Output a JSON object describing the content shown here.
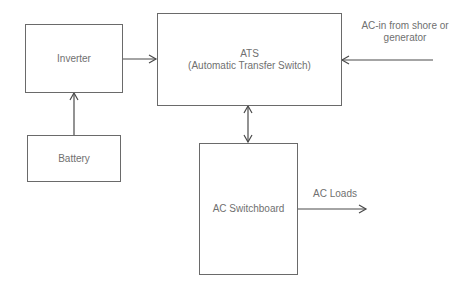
{
  "diagram": {
    "nodes": [
      {
        "id": "inverter",
        "label": "Inverter"
      },
      {
        "id": "ats",
        "label_line1": "ATS",
        "label_line2": "(Automatic Transfer Switch)"
      },
      {
        "id": "battery",
        "label": "Battery"
      },
      {
        "id": "ac_switchboard",
        "label": "AC Switchboard"
      }
    ],
    "edge_labels": {
      "ac_in": "AC-in from shore or generator",
      "ac_in_line1": "AC-in from shore or",
      "ac_in_line2": "generator",
      "ac_loads": "AC Loads"
    },
    "edges": [
      {
        "from": "battery",
        "to": "inverter",
        "type": "arrow"
      },
      {
        "from": "inverter",
        "to": "ats",
        "type": "arrow"
      },
      {
        "from": "ac_in",
        "to": "ats",
        "type": "arrow"
      },
      {
        "from": "ats",
        "to": "ac_switchboard",
        "type": "double-arrow"
      },
      {
        "from": "ac_switchboard",
        "to": "ac_loads",
        "type": "arrow"
      }
    ],
    "colors": {
      "line": "#4a4a4a",
      "text": "#707070"
    }
  }
}
